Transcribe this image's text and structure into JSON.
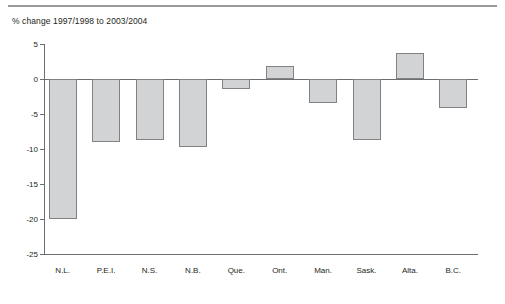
{
  "chart_data": {
    "type": "bar",
    "title": "% change 1997/1998 to 2003/2004",
    "xlabel": "",
    "ylabel": "",
    "categories": [
      "N.L.",
      "P.E.I.",
      "N.S.",
      "N.B.",
      "Que.",
      "Ont.",
      "Man.",
      "Sask.",
      "Alta.",
      "B.C."
    ],
    "values": [
      -20.0,
      -9.0,
      -8.7,
      -9.7,
      -1.4,
      1.9,
      -3.4,
      -8.7,
      3.7,
      -4.1
    ],
    "ylim": [
      -25,
      5
    ],
    "yticks": [
      5,
      0,
      -5,
      -10,
      -15,
      -20,
      -25
    ],
    "ytick_labels": [
      "5",
      "0",
      "-5",
      "-10",
      "-15",
      "-20",
      "-25"
    ],
    "grid": false,
    "legend": "none",
    "bar_fill_color": "#d2d3d5",
    "bar_border_color": "#808285",
    "axis_color": "#6d6e71"
  },
  "figure": {
    "top_rule_color": "#9a9a9a",
    "background_color": "#ffffff",
    "footer_note": ""
  }
}
